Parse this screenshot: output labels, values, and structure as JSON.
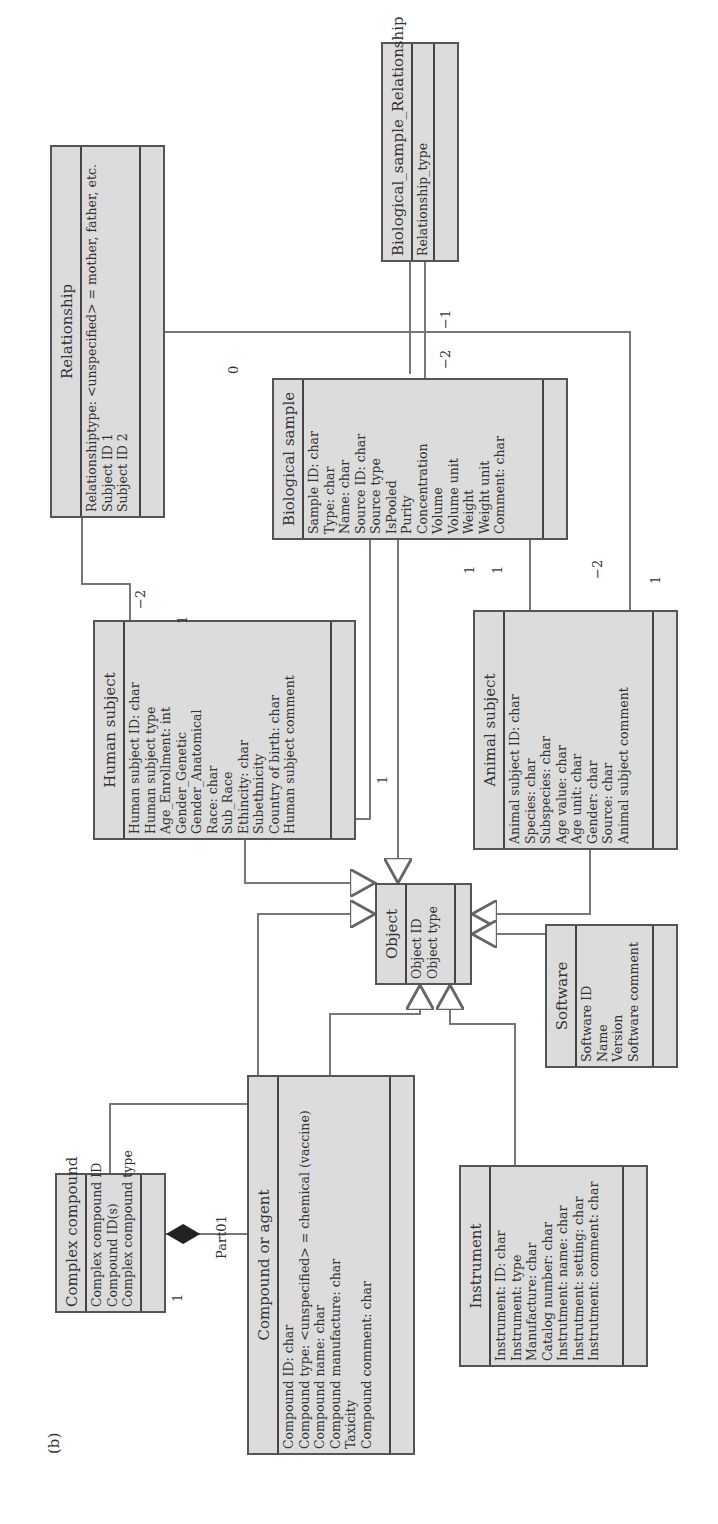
{
  "figure_label": "(b)",
  "classes": {
    "bio_rel": {
      "name": "Biological_sample_Relationship",
      "attributes": [
        "Relationship_type"
      ]
    },
    "relationship": {
      "name": "Relationship",
      "attributes": [
        "Relationshiptype: <unspecified> = mother, father, etc.",
        "Subject ID 1",
        "Subject ID 2"
      ]
    },
    "biological_sample": {
      "name": "Biological sample",
      "attributes": [
        "Sample ID: char",
        "Type: char",
        "Name: char",
        "Source ID: char",
        "Source type",
        "IsPooled",
        "Purity",
        "Concentration",
        "Volume",
        "Volume unit",
        "Weight",
        "Weight unit",
        "Comment: char"
      ]
    },
    "human_subject": {
      "name": "Human subject",
      "attributes": [
        "Human subject ID: char",
        "Human subject type",
        "Age_Enrollment: int",
        "Gender_Genetic",
        "Gender_Anatomical",
        "Race: char",
        "Sub_Race",
        "Ethincity: char",
        "Subethnicity",
        "Country of birth: char",
        "Human subject comment"
      ]
    },
    "animal_subject": {
      "name": "Animal subject",
      "attributes": [
        "Animal subject ID: char",
        "Species: char",
        "Subspecies: char",
        "Age value: char",
        "Age unit: char",
        "Gender: char",
        "Source: char",
        "Animal subject comment"
      ]
    },
    "object": {
      "name": "Object",
      "attributes": [
        "Object ID",
        "Object type"
      ]
    },
    "software": {
      "name": "Software",
      "attributes": [
        "Software ID",
        "Name",
        "Version",
        "Software comment"
      ]
    },
    "complex_compound": {
      "name": "Complex compound",
      "attributes": [
        "Complex compound ID",
        "Compound ID(s)",
        "Complex compound type"
      ]
    },
    "compound_agent": {
      "name": "Compound or agent",
      "attributes": [
        "Compound ID: char",
        "Compound type: <unspecified> = chemical (vaccine)",
        "Compound name: char",
        "Compound manufacture: char",
        "Taxicity",
        "Compound comment: char"
      ]
    },
    "instrument": {
      "name": "Instrument",
      "attributes": [
        "Instrument: ID: char",
        "Instrument: type",
        "Manufacture: char",
        "Catalog number: char",
        "Instrutment: name: char",
        "Instrutment: setting: char",
        "Instrutment: comment: char"
      ]
    }
  },
  "multiplicities": {
    "bio_rel_a": "−1",
    "bio_rel_b": "−2",
    "human_rel": "−2",
    "human_rel_1": "1",
    "bio_human_0": "0",
    "bio_human_1": "1",
    "bio_animal_1a": "1",
    "bio_animal_1b": "1",
    "animal_rel_m2": "−2",
    "animal_rel_1": "1",
    "composition_1": "1",
    "composition_role": "Part01"
  },
  "colors": {
    "class_fill": "#dcdcdc",
    "border": "#555555",
    "line": "#777777"
  }
}
